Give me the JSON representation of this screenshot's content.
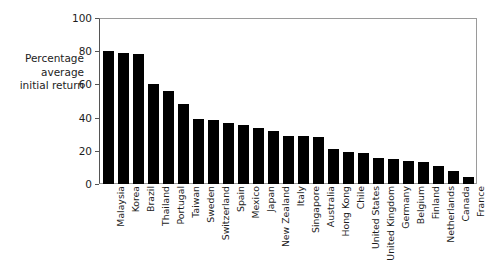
{
  "chart_data": {
    "type": "bar",
    "title": "",
    "subtitle": "",
    "xlabel": "",
    "ylabel": "Percentage\naverage\ninitial return",
    "ylim": [
      0,
      100
    ],
    "ytick_labels": [
      "0",
      "20",
      "40",
      "60",
      "80",
      "100"
    ],
    "ytick_values": [
      0,
      20,
      40,
      60,
      80,
      100
    ],
    "grid": false,
    "legend": null,
    "bar_color": "#000000",
    "axis_color": "#555555",
    "frame_color": "#9a9a9a",
    "orientation": "vertical",
    "sorted": "descending",
    "categories": [
      "Malaysia",
      "Korea",
      "Brazil",
      "Thailand",
      "Portugal",
      "Taiwan",
      "Sweden",
      "Switzerland",
      "Spain",
      "Mexico",
      "Japan",
      "New Zealand",
      "Italy",
      "Singapore",
      "Australia",
      "Hong Kong",
      "Chile",
      "United States",
      "United Kingdom",
      "Germany",
      "Belgium",
      "Finland",
      "Netherlands",
      "Canada",
      "France"
    ],
    "values": [
      80,
      79,
      78.5,
      60,
      56,
      48,
      39,
      38.5,
      37,
      35.5,
      34,
      32,
      29,
      29,
      28.5,
      21,
      19.5,
      18.5,
      15.5,
      15,
      14,
      13,
      11,
      8,
      4
    ]
  }
}
